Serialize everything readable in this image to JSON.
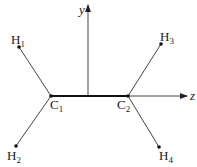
{
  "diagram": {
    "type": "molecular-coordinate-diagram",
    "axes": {
      "y": {
        "label": "y"
      },
      "z": {
        "label": "z"
      }
    },
    "atoms": [
      {
        "id": "C1",
        "symbol": "C",
        "sub": "1"
      },
      {
        "id": "C2",
        "symbol": "C",
        "sub": "2"
      },
      {
        "id": "H1",
        "symbol": "H",
        "sub": "1"
      },
      {
        "id": "H2",
        "symbol": "H",
        "sub": "2"
      },
      {
        "id": "H3",
        "symbol": "H",
        "sub": "3"
      },
      {
        "id": "H4",
        "symbol": "H",
        "sub": "4"
      }
    ],
    "bonds": [
      {
        "from": "C1",
        "to": "C2",
        "style": "thick"
      },
      {
        "from": "C1",
        "to": "H1"
      },
      {
        "from": "C1",
        "to": "H2"
      },
      {
        "from": "C2",
        "to": "H3"
      },
      {
        "from": "C2",
        "to": "H4"
      }
    ],
    "colors": {
      "line": "#333333",
      "dot": "#111111",
      "background": "#ffffff"
    }
  }
}
